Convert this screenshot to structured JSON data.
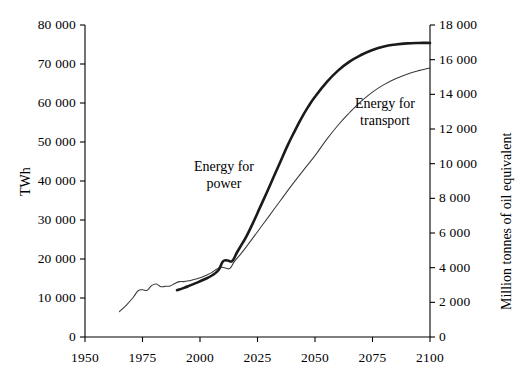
{
  "chart_data": {
    "type": "line",
    "title": "",
    "subtitle": "",
    "xlabel": "",
    "ylabel": "TWh",
    "ylabel_right": "Million tonnes of oil equivalent",
    "xlim": [
      1950,
      2100
    ],
    "ylim": [
      0,
      80000
    ],
    "ylim_right": [
      0,
      18000
    ],
    "grid": false,
    "legend_position": "inline-annotations",
    "axis_note": "Left axis TWh 0-80 000 step 10 000; right axis Mtoe 0-18 000 step 2 000; x axis 1950-2100 step 25",
    "xticks": [
      1950,
      1975,
      2000,
      2025,
      2050,
      2075,
      2100
    ],
    "xtick_labels": [
      "1950",
      "1975",
      "2000",
      "2025",
      "2050",
      "2075",
      "2100"
    ],
    "yticks_left": [
      0,
      10000,
      20000,
      30000,
      40000,
      50000,
      60000,
      70000,
      80000
    ],
    "ytick_labels_left": [
      "0",
      "10 000",
      "20 000",
      "30 000",
      "40 000",
      "50 000",
      "60 000",
      "70 000",
      "80 000"
    ],
    "yticks_right": [
      0,
      2000,
      4000,
      6000,
      8000,
      10000,
      12000,
      14000,
      16000,
      18000
    ],
    "ytick_labels_right": [
      "0",
      "2 000",
      "4 000",
      "6 000",
      "8 000",
      "10 000",
      "12 000",
      "14 000",
      "16 000",
      "18 000"
    ],
    "series": [
      {
        "name": "Energy for power",
        "label": "Energy for\npower",
        "label_line1": "Energy for",
        "label_line2": "power",
        "style": "thick",
        "color": "#1a1a1a",
        "x": [
          1990,
          1993,
          1996,
          1999,
          2002,
          2005,
          2008,
          2010,
          2012,
          2014,
          2016,
          2018,
          2020,
          2023,
          2026,
          2029,
          2032,
          2035,
          2038,
          2041,
          2044,
          2047,
          2050,
          2055,
          2060,
          2065,
          2070,
          2075,
          2080,
          2085,
          2090,
          2095,
          2100
        ],
        "y": [
          12000,
          12600,
          13300,
          14000,
          14800,
          15700,
          17100,
          19400,
          19600,
          19500,
          21600,
          23600,
          25600,
          29200,
          33100,
          37000,
          41000,
          45000,
          49000,
          52600,
          56000,
          59000,
          61600,
          65300,
          68300,
          70600,
          72300,
          73600,
          74500,
          75000,
          75300,
          75400,
          75400
        ]
      },
      {
        "name": "Energy for transport",
        "label": "Energy for\ntransport",
        "label_line1": "Energy for",
        "label_line2": "transport",
        "style": "thin",
        "color": "#3a3a3a",
        "x": [
          1965,
          1968,
          1971,
          1973,
          1975,
          1977,
          1979,
          1981,
          1983,
          1985,
          1987,
          1989,
          1991,
          1993,
          1995,
          1997,
          1999,
          2001,
          2003,
          2005,
          2007,
          2009,
          2011,
          2013,
          2015,
          2018,
          2021,
          2025,
          2030,
          2035,
          2040,
          2045,
          2050,
          2055,
          2060,
          2065,
          2070,
          2075,
          2080,
          2085,
          2090,
          2095,
          2100
        ],
        "y": [
          6500,
          8200,
          10200,
          11800,
          12100,
          12000,
          13200,
          13600,
          12900,
          13000,
          13100,
          13700,
          14200,
          14200,
          14400,
          14700,
          15000,
          15400,
          15900,
          16500,
          17300,
          17900,
          17700,
          17600,
          19400,
          21500,
          23800,
          27000,
          31000,
          35000,
          39000,
          42800,
          46500,
          50600,
          54300,
          57500,
          60400,
          62800,
          64700,
          66200,
          67400,
          68300,
          69000
        ]
      }
    ]
  },
  "annotations": {
    "power_label_line1": "Energy for",
    "power_label_line2": "power",
    "transport_label_line1": "Energy for",
    "transport_label_line2": "transport"
  },
  "axes": {
    "left_title": "TWh",
    "right_title": "Million tonnes of oil equivalent"
  }
}
